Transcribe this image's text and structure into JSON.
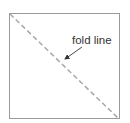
{
  "diagram": {
    "label": "fold line",
    "colors": {
      "square_border": "#9a9a9a",
      "fold_line": "#a8a8a8",
      "text": "#333333",
      "arrow": "#333333"
    }
  }
}
